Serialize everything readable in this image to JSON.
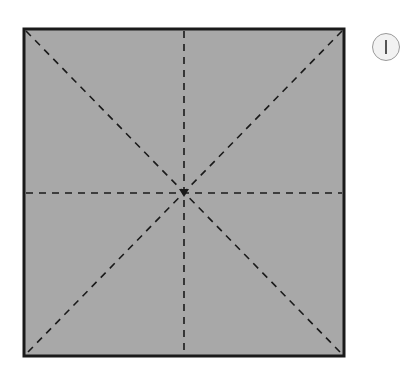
{
  "diagram": {
    "step_number": "1",
    "square": {
      "x": 24,
      "y": 29,
      "width": 320,
      "height": 327,
      "fill": "#a8a8a8",
      "stroke": "#1a1a1a"
    },
    "fold_lines": [
      {
        "name": "diagonal-top-left-to-bottom-right",
        "style": "dashed"
      },
      {
        "name": "diagonal-top-right-to-bottom-left",
        "style": "dashed"
      },
      {
        "name": "vertical-center",
        "style": "dashed"
      },
      {
        "name": "horizontal-center",
        "style": "dashed"
      }
    ],
    "center": {
      "x": 184,
      "y": 193
    }
  }
}
